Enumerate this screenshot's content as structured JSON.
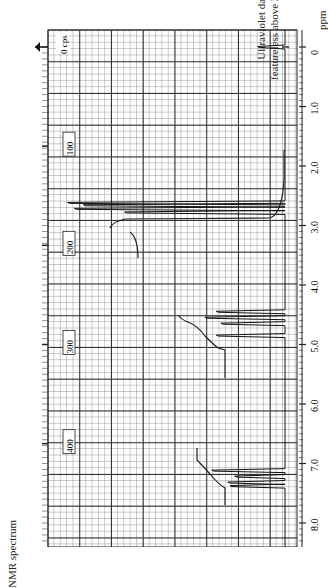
{
  "chart_data": {
    "type": "line",
    "title": "NMR spectrum",
    "subtitle": "Ultraviolet data: featureless above 210 mμ",
    "orientation": "rotated 90° (ppm axis vertical, intensity horizontal leftward)",
    "xlabel": "ppm",
    "ylabel": "",
    "x_ticks": [
      "0",
      "1.0",
      "2.0",
      "3.0",
      "4.0",
      "5.0",
      "6.0",
      "7.0",
      "8.0"
    ],
    "cps_ticks": [
      "0 cps",
      "100",
      "200",
      "300",
      "400"
    ],
    "xlim": [
      0,
      8.3
    ],
    "grid": true,
    "reference_marker": {
      "ppm": 0,
      "label": "0 cps"
    },
    "peaks": [
      {
        "ppm": 0.0,
        "relative_height": 0.12,
        "note": "TMS reference"
      },
      {
        "ppm": 2.62,
        "relative_height": 0.95
      },
      {
        "ppm": 2.66,
        "relative_height": 0.88
      },
      {
        "ppm": 2.72,
        "relative_height": 0.92
      },
      {
        "ppm": 2.78,
        "relative_height": 0.7
      },
      {
        "ppm": 4.45,
        "relative_height": 0.3
      },
      {
        "ppm": 4.55,
        "relative_height": 0.35
      },
      {
        "ppm": 4.65,
        "relative_height": 0.28
      },
      {
        "ppm": 4.85,
        "relative_height": 0.3
      },
      {
        "ppm": 7.12,
        "relative_height": 0.32
      },
      {
        "ppm": 7.22,
        "relative_height": 0.22
      },
      {
        "ppm": 7.32,
        "relative_height": 0.25
      },
      {
        "ppm": 7.38,
        "relative_height": 0.24
      }
    ],
    "integrals": [
      {
        "from_ppm": 1.9,
        "to_ppm": 3.2,
        "start_x": 0.1,
        "end_x": 0.73
      },
      {
        "from_ppm": 4.2,
        "to_ppm": 5.1,
        "start_x": 0.23,
        "end_x": 0.44
      },
      {
        "from_ppm": 6.7,
        "to_ppm": 7.5,
        "start_x": 0.44,
        "end_x": 0.62
      }
    ]
  },
  "labels": {
    "uv_line1": "Ultraviolet data:",
    "uv_line2": "featureless above 210 mμ",
    "nmr": "NMR spectrum",
    "ppm": "ppm",
    "cps0": "0 cps"
  }
}
